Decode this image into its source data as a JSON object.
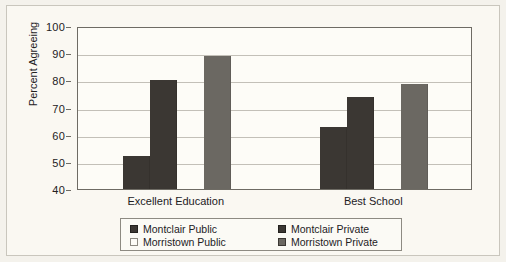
{
  "figure": {
    "background_color": "#f4f2ec",
    "plot_background_color": "#fdfcf7",
    "frame_color": "#6e6b64",
    "grid_color": "#c3c0b8"
  },
  "chart_data": {
    "type": "bar",
    "title": "",
    "subtitle": "",
    "xlabel": "",
    "ylabel": "Percent Agreeing",
    "categories": [
      "Excellent Education",
      "Best School"
    ],
    "series": [
      {
        "name": "Montclair Public",
        "values": [
          52,
          63
        ],
        "color": "#3b3733"
      },
      {
        "name": "Montclair Private",
        "values": [
          80,
          74
        ],
        "color": "#3b3733"
      },
      {
        "name": "Morristown Public",
        "values": [
          40,
          40
        ],
        "color": "#fdfcf7"
      },
      {
        "name": "Morristown Private",
        "values": [
          89,
          78.5
        ],
        "color": "#6b6862"
      }
    ],
    "ylim": [
      40,
      100
    ],
    "yticks": [
      40,
      50,
      60,
      70,
      80,
      90,
      100
    ],
    "ytick_labels": [
      "40",
      "50",
      "60",
      "70",
      "80",
      "90",
      "100"
    ],
    "grid": true,
    "grid_axis": "y",
    "legend_position": "bottom"
  },
  "legend": {
    "entries": [
      {
        "label": "Montclair Public",
        "color": "#3b3733",
        "border": "#23211e"
      },
      {
        "label": "Montclair Private",
        "color": "#3b3733",
        "border": "#23211e"
      },
      {
        "label": "Morristown Public",
        "color": "#fdfcf7",
        "border": "#8d8a82"
      },
      {
        "label": "Morristown Private",
        "color": "#6b6862",
        "border": "#3b3733"
      }
    ]
  }
}
